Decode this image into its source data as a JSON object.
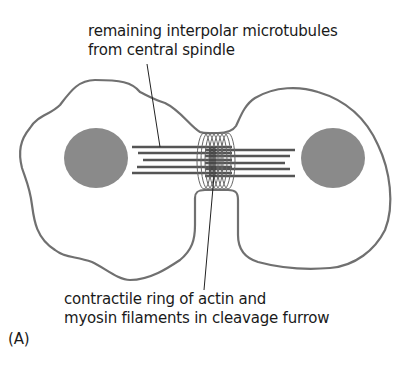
{
  "diagram": {
    "type": "cell-division-cytokinesis",
    "labels": {
      "top": [
        "remaining interpolar microtubules",
        "from central spindle"
      ],
      "bottom": [
        "contractile ring of actin and",
        "myosin filaments in cleavage furrow"
      ],
      "panel": "(A)"
    },
    "colors": {
      "outline": "#707070",
      "nucleus": "#8a8a8a",
      "microtubule": "#555555",
      "ring": "#666666",
      "leader_line": "#222222"
    },
    "parts": [
      "left-daughter-cell",
      "right-daughter-cell",
      "left-nucleus",
      "right-nucleus",
      "interpolar-microtubules",
      "contractile-ring",
      "cleavage-furrow"
    ]
  }
}
